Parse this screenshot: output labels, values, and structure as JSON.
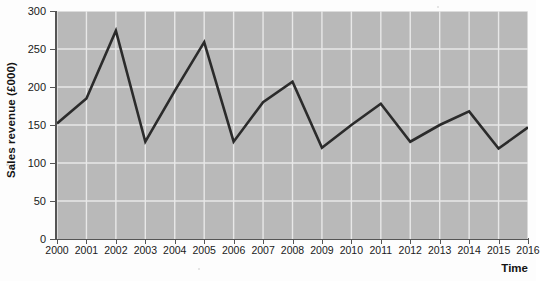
{
  "chart_data": {
    "type": "line",
    "title": "",
    "subtitle": "",
    "xlabel": "Time",
    "ylabel": "Sales revenue (£000)",
    "categories": [
      "2000",
      "2001",
      "2002",
      "2003",
      "2004",
      "2005",
      "2006",
      "2007",
      "2008",
      "2009",
      "2010",
      "2011",
      "2012",
      "2013",
      "2014",
      "2015",
      "2016"
    ],
    "values": [
      152,
      185,
      274,
      128,
      195,
      259,
      128,
      180,
      207,
      120,
      150,
      178,
      128,
      150,
      168,
      119,
      147
    ],
    "series": [
      {
        "name": "Sales revenue",
        "values": [
          152,
          185,
          274,
          128,
          195,
          259,
          128,
          180,
          207,
          120,
          150,
          178,
          128,
          150,
          168,
          119,
          147
        ]
      }
    ],
    "xlim": [
      2000,
      2016
    ],
    "ylim": [
      0,
      300
    ],
    "y_ticks": [
      0,
      50,
      100,
      150,
      200,
      250,
      300
    ],
    "x_ticks": [
      "2000",
      "2001",
      "2002",
      "2003",
      "2004",
      "2005",
      "2006",
      "2007",
      "2008",
      "2009",
      "2010",
      "2011",
      "2012",
      "2013",
      "2014",
      "2015",
      "2016"
    ],
    "grid": true,
    "grid_color": "#e8e8e8",
    "legend": false,
    "legend_position": "none",
    "line_color": "#2b2b2b",
    "plot_background": "#b9b9b9",
    "figure_background": "#fdfdfd",
    "annotations": []
  },
  "axes": {
    "y_title": "Sales revenue (£000)",
    "x_title": "Time",
    "y_tick_labels": [
      "300",
      "250",
      "200",
      "150",
      "100",
      "50",
      "0"
    ],
    "x_tick_labels": [
      "2000",
      "2001",
      "2002",
      "2003",
      "2004",
      "2005",
      "2006",
      "2007",
      "2008",
      "2009",
      "2010",
      "2011",
      "2012",
      "2013",
      "2014",
      "2015",
      "2016"
    ]
  }
}
